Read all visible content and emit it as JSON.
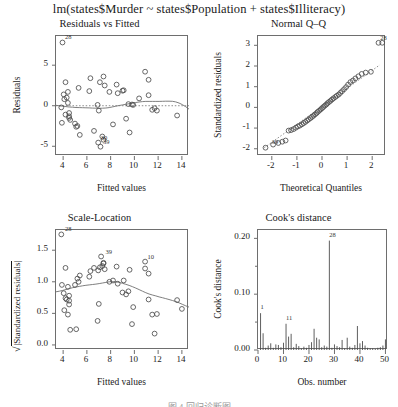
{
  "figure": {
    "main_title": "lm(states$Murder ~ states$Population + states$Illiteracy)",
    "footer_caption": "图 4 回归诊断图",
    "point_color": "#4d4d4d",
    "line_color": "#707070",
    "box_color": "#6e6e6e"
  },
  "chart_data": [
    {
      "type": "scatter",
      "id": "residuals-vs-fitted",
      "title": "Residuals vs Fitted",
      "xlabel": "Fitted values",
      "ylabel": "Residuals",
      "xlim": [
        3.4,
        14.6
      ],
      "ylim": [
        -6.2,
        8.6
      ],
      "xticks": [
        4,
        6,
        8,
        10,
        12,
        14
      ],
      "yticks": [
        -5,
        0,
        5
      ],
      "grid": false,
      "reference_line": {
        "type": "hline",
        "y": 0,
        "style": "dotted"
      },
      "smoother": "lowess",
      "annotations": [
        {
          "label": "28",
          "x": 3.95,
          "y": 7.8
        },
        {
          "label": "39",
          "x": 7.15,
          "y": -5.05
        },
        {
          "label": "30",
          "x": 6.95,
          "y": -4.55
        }
      ],
      "x": [
        10.9,
        6.9,
        9.6,
        8.5,
        11.2,
        6.3,
        4.4,
        7.4,
        11.2,
        11.9,
        4.5,
        4.4,
        9.1,
        6.6,
        4.3,
        5.3,
        8.2,
        11.5,
        4.2,
        9.3,
        6.2,
        9.8,
        5.0,
        11.7,
        7.4,
        4.1,
        4.5,
        3.95,
        3.9,
        6.95,
        7.3,
        9.5,
        9.9,
        4.05,
        7.1,
        7.9,
        4.5,
        7.5,
        7.15,
        10.4,
        4.2,
        9.0,
        13.6,
        5.2,
        3.85,
        8.6,
        5.4,
        7.0,
        5.1,
        4.6
      ],
      "y": [
        4.2,
        0.1,
        -3.3,
        2.6,
        3.2,
        3.4,
        0.35,
        -4.2,
        1.3,
        -0.6,
        -1.3,
        1.7,
        1.9,
        -3.1,
        1.0,
        2.2,
        -2.3,
        -0.5,
        2.9,
        -1.6,
        1.8,
        0.15,
        -2.2,
        -0.3,
        3.6,
        0.8,
        -0.9,
        7.8,
        -2.1,
        -4.55,
        -3.8,
        0.2,
        0.1,
        1.4,
        2.9,
        1.7,
        -1.5,
        2.5,
        -5.05,
        0.9,
        -1.1,
        1.85,
        -1.2,
        -2.5,
        -0.2,
        1.55,
        -3.6,
        -0.6,
        -2.6,
        -1.75
      ]
    },
    {
      "type": "scatter",
      "id": "normal-qq",
      "title": "Normal Q–Q",
      "xlabel": "Theoretical Quantiles",
      "ylabel": "Standardized residuals",
      "xlim": [
        -2.55,
        2.55
      ],
      "ylim": [
        -2.35,
        3.45
      ],
      "xticks": [
        -2,
        -1,
        0,
        1,
        2
      ],
      "yticks": [
        -2,
        -1,
        0,
        1,
        2,
        3
      ],
      "grid": false,
      "reference_line": {
        "type": "qqline",
        "style": "dotted"
      },
      "annotations": [
        {
          "label": "28",
          "x": 2.22,
          "y": 3.12
        },
        {
          "label": "39",
          "x": -2.1,
          "y": -1.93
        }
      ],
      "x": [
        -2.25,
        -1.95,
        -1.74,
        -1.58,
        -1.45,
        -1.33,
        -1.23,
        -1.13,
        -1.04,
        -0.96,
        -0.88,
        -0.8,
        -0.73,
        -0.66,
        -0.59,
        -0.53,
        -0.46,
        -0.4,
        -0.34,
        -0.28,
        -0.22,
        -0.17,
        -0.11,
        -0.05,
        0.0,
        0.05,
        0.11,
        0.17,
        0.22,
        0.28,
        0.34,
        0.4,
        0.46,
        0.53,
        0.59,
        0.66,
        0.73,
        0.8,
        0.88,
        0.96,
        1.04,
        1.13,
        1.23,
        1.33,
        1.45,
        1.58,
        1.74,
        1.95,
        2.25,
        2.4
      ],
      "y": [
        -1.95,
        -1.8,
        -1.72,
        -1.66,
        -1.6,
        -1.12,
        -1.1,
        -1.05,
        -0.98,
        -0.92,
        -0.88,
        -0.82,
        -0.76,
        -0.7,
        -0.64,
        -0.58,
        -0.52,
        -0.46,
        -0.4,
        -0.34,
        -0.28,
        -0.22,
        -0.16,
        -0.1,
        -0.04,
        0.02,
        0.08,
        0.14,
        0.2,
        0.26,
        0.32,
        0.38,
        0.44,
        0.5,
        0.56,
        0.62,
        0.7,
        0.78,
        0.88,
        0.98,
        1.1,
        1.22,
        1.3,
        1.4,
        1.5,
        1.62,
        1.68,
        1.72,
        3.12,
        3.12
      ]
    },
    {
      "type": "scatter",
      "id": "scale-location",
      "title": "Scale-Location",
      "xlabel": "Fitted values",
      "ylabel": "sqrt(|Standardized residuals|)",
      "xlim": [
        3.4,
        14.6
      ],
      "ylim": [
        -0.08,
        1.82
      ],
      "xticks": [
        4,
        6,
        8,
        10,
        12,
        14
      ],
      "yticks": [
        0.0,
        0.5,
        1.0,
        1.5
      ],
      "grid": false,
      "smoother": "lowess",
      "annotations": [
        {
          "label": "28",
          "x": 3.95,
          "y": 1.75
        },
        {
          "label": "39",
          "x": 7.35,
          "y": 1.4
        },
        {
          "label": "10",
          "x": 10.9,
          "y": 1.32
        }
      ],
      "x": [
        10.9,
        6.9,
        9.6,
        8.5,
        11.2,
        6.3,
        4.4,
        7.4,
        11.2,
        11.9,
        4.5,
        4.4,
        9.1,
        6.6,
        4.3,
        5.3,
        8.2,
        11.5,
        4.2,
        9.3,
        6.2,
        9.8,
        5.0,
        11.7,
        7.4,
        4.1,
        4.5,
        3.85,
        3.9,
        6.95,
        7.3,
        9.5,
        9.9,
        4.05,
        7.1,
        7.9,
        4.5,
        7.5,
        7.2,
        10.9,
        4.2,
        9.0,
        13.6,
        5.2,
        4.6,
        8.6,
        5.4,
        7.0,
        5.1,
        14.0
      ],
      "y": [
        1.21,
        0.38,
        1.19,
        1.24,
        1.13,
        1.17,
        0.48,
        1.29,
        0.72,
        0.49,
        0.78,
        0.92,
        1.02,
        1.22,
        0.72,
        1.0,
        1.02,
        0.48,
        1.22,
        0.8,
        1.08,
        0.33,
        0.95,
        0.18,
        1.3,
        0.55,
        0.64,
        1.75,
        0.95,
        1.18,
        1.25,
        0.85,
        0.6,
        0.82,
        1.23,
        1.0,
        0.7,
        1.2,
        1.4,
        1.32,
        0.74,
        0.83,
        0.71,
        1.05,
        0.24,
        0.97,
        1.1,
        0.65,
        0.25,
        0.57
      ]
    },
    {
      "type": "bar",
      "id": "cooks-distance",
      "title": "Cook's distance",
      "xlabel": "Obs. number",
      "ylabel": "Cook's distance",
      "xlim": [
        0,
        51
      ],
      "ylim": [
        0,
        0.215
      ],
      "xticks": [
        0,
        10,
        20,
        30,
        40,
        50
      ],
      "yticks": [
        0.0,
        0.1,
        0.2
      ],
      "yticks_minor": [
        0.05,
        0.15
      ],
      "grid": false,
      "annotations": [
        {
          "label": "1",
          "x": 1,
          "y": 0.066
        },
        {
          "label": "11",
          "x": 11,
          "y": 0.047
        },
        {
          "label": "28",
          "x": 28,
          "y": 0.196
        }
      ],
      "categories": [
        1,
        2,
        3,
        4,
        5,
        6,
        7,
        8,
        9,
        10,
        11,
        12,
        13,
        14,
        15,
        16,
        17,
        18,
        19,
        20,
        21,
        22,
        23,
        24,
        25,
        26,
        27,
        28,
        29,
        30,
        31,
        32,
        33,
        34,
        35,
        36,
        37,
        38,
        39,
        40,
        41,
        42,
        43,
        44,
        45,
        46,
        47,
        48,
        49,
        50
      ],
      "values": [
        0.066,
        0.03,
        0.004,
        0.008,
        0.012,
        0.004,
        0.01,
        0.009,
        0.005,
        0.013,
        0.047,
        0.024,
        0.029,
        0.005,
        0.011,
        0.007,
        0.003,
        0.006,
        0.004,
        0.009,
        0.014,
        0.038,
        0.022,
        0.019,
        0.005,
        0.008,
        0.006,
        0.196,
        0.004,
        0.01,
        0.007,
        0.005,
        0.018,
        0.003,
        0.022,
        0.006,
        0.004,
        0.009,
        0.043,
        0.012,
        0.016,
        0.008,
        0.004,
        0.003,
        0.003,
        0.002,
        0.004,
        0.005,
        0.008,
        0.019
      ]
    }
  ]
}
